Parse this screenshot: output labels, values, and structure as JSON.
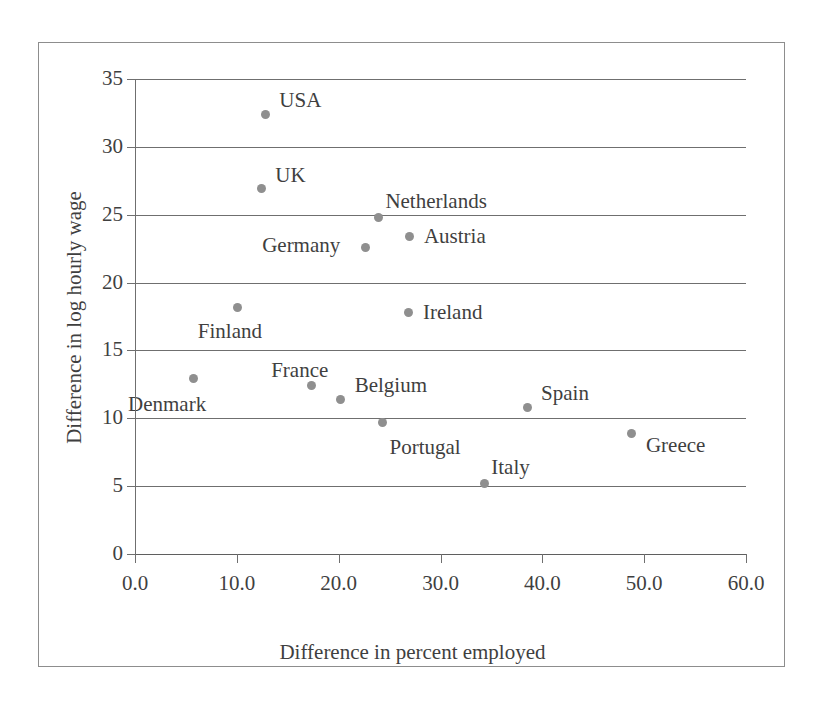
{
  "chart_data": {
    "type": "scatter",
    "title": "",
    "xlabel": "Difference in percent employed",
    "ylabel": "Difference in log hourly wage",
    "xlim": [
      0,
      60
    ],
    "ylim": [
      0,
      35
    ],
    "xticks": [
      "0.0",
      "10.0",
      "20.0",
      "30.0",
      "40.0",
      "50.0",
      "60.0"
    ],
    "xtick_values": [
      0,
      10,
      20,
      30,
      40,
      50,
      60
    ],
    "yticks": [
      "0",
      "5",
      "10",
      "15",
      "20",
      "25",
      "30",
      "35"
    ],
    "ytick_values": [
      0,
      5,
      10,
      15,
      20,
      25,
      30,
      35
    ],
    "grid": "horizontal",
    "legend": "none",
    "marker_color": "#8f8f8f",
    "points": [
      {
        "label": "USA",
        "x": 12.8,
        "y": 32.4,
        "label_dx": 14,
        "label_dy": -24
      },
      {
        "label": "UK",
        "x": 12.4,
        "y": 26.9,
        "label_dx": 14,
        "label_dy": -24
      },
      {
        "label": "Netherlands",
        "x": 23.9,
        "y": 24.8,
        "label_dx": 7,
        "label_dy": -26
      },
      {
        "label": "Austria",
        "x": 27.0,
        "y": 23.4,
        "label_dx": 14,
        "label_dy": -10
      },
      {
        "label": "Germany",
        "x": 22.6,
        "y": 22.6,
        "label_dx": -103,
        "label_dy": -12
      },
      {
        "label": "Ireland",
        "x": 26.9,
        "y": 17.8,
        "label_dx": 14,
        "label_dy": -10
      },
      {
        "label": "Finland",
        "x": 10.1,
        "y": 18.2,
        "label_dx": -40,
        "label_dy": 14
      },
      {
        "label": "Denmark",
        "x": 5.7,
        "y": 12.9,
        "label_dx": -65,
        "label_dy": 15
      },
      {
        "label": "France",
        "x": 17.3,
        "y": 12.4,
        "label_dx": -40,
        "label_dy": -26
      },
      {
        "label": "Belgium",
        "x": 20.2,
        "y": 11.4,
        "label_dx": 14,
        "label_dy": -24
      },
      {
        "label": "Portugal",
        "x": 24.3,
        "y": 9.7,
        "label_dx": 7,
        "label_dy": 15
      },
      {
        "label": "Spain",
        "x": 38.5,
        "y": 10.8,
        "label_dx": 14,
        "label_dy": -24
      },
      {
        "label": "Greece",
        "x": 48.8,
        "y": 8.9,
        "label_dx": 14,
        "label_dy": 2
      },
      {
        "label": "Italy",
        "x": 34.3,
        "y": 5.2,
        "label_dx": 7,
        "label_dy": -26
      }
    ]
  }
}
